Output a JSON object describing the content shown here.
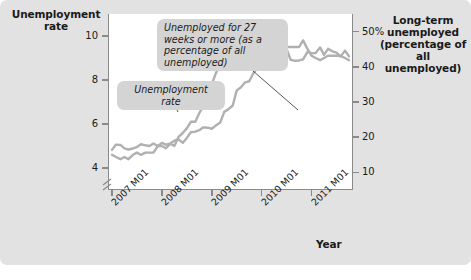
{
  "figure": {
    "background_color": "#e2e2e2",
    "plot_background": "#ffffff",
    "series_color": "#b0b0b0",
    "callout_bg": "#d4d4d4",
    "axis_color": "#8a8a8a"
  },
  "labels": {
    "left_axis_title": "Unemployment rate",
    "right_axis_title": "Long-term unemployed (percentage of all unemployed)",
    "x_axis_title": "Year",
    "callout_longterm": "Unemployed for 27 weeks or more (as a percentage of all unemployed)",
    "callout_urate": "Unemployment rate"
  },
  "chart_data": {
    "type": "line",
    "title": "",
    "xlabel": "Year",
    "ylabel": "Unemployment rate",
    "y2label": "Long-term unemployed (percentage of all unemployed)",
    "grid": false,
    "legend_position": "inline-callouts",
    "x_tick_labels": [
      "2007 M01",
      "2008 M01",
      "2009 M01",
      "2010 M01",
      "2011 M01"
    ],
    "x_tick_values": [
      2007.0,
      2008.0,
      2009.0,
      2010.0,
      2011.0
    ],
    "xlim": [
      2006.92,
      2011.83
    ],
    "y_left_ticks": [
      "4",
      "6",
      "8",
      "10"
    ],
    "y_left_tick_values": [
      4,
      6,
      8,
      10
    ],
    "ylim_left": [
      3.0,
      11.0
    ],
    "y_left_axis_break": true,
    "y_right_ticks": [
      "10",
      "20",
      "30",
      "40",
      "50%"
    ],
    "y_right_tick_values": [
      10,
      20,
      30,
      40,
      50
    ],
    "ylim_right": [
      5.0,
      55.0
    ],
    "x": [
      2007.0,
      2007.08,
      2007.17,
      2007.25,
      2007.33,
      2007.42,
      2007.5,
      2007.58,
      2007.67,
      2007.75,
      2007.83,
      2007.92,
      2008.0,
      2008.08,
      2008.17,
      2008.25,
      2008.33,
      2008.42,
      2008.5,
      2008.58,
      2008.67,
      2008.75,
      2008.83,
      2008.92,
      2009.0,
      2009.08,
      2009.17,
      2009.25,
      2009.33,
      2009.42,
      2009.5,
      2009.58,
      2009.67,
      2009.75,
      2009.83,
      2009.92,
      2010.0,
      2010.08,
      2010.17,
      2010.25,
      2010.33,
      2010.42,
      2010.5,
      2010.58,
      2010.67,
      2010.75,
      2010.83,
      2010.92,
      2011.0,
      2011.08,
      2011.17,
      2011.25,
      2011.33,
      2011.42,
      2011.5,
      2011.58,
      2011.67,
      2011.75
    ],
    "series": [
      {
        "name": "Unemployment rate",
        "axis": "left",
        "unit": "percent",
        "values": [
          4.6,
          4.5,
          4.4,
          4.5,
          4.4,
          4.6,
          4.7,
          4.6,
          4.7,
          4.7,
          4.7,
          5.0,
          5.0,
          4.9,
          5.1,
          5.0,
          5.4,
          5.6,
          5.8,
          6.1,
          6.1,
          6.5,
          6.8,
          7.3,
          7.8,
          8.3,
          8.7,
          9.0,
          9.4,
          9.5,
          9.5,
          9.6,
          9.8,
          10.0,
          9.9,
          9.9,
          9.8,
          9.8,
          9.9,
          9.9,
          9.6,
          9.4,
          9.5,
          9.5,
          9.5,
          9.5,
          9.8,
          9.4,
          9.1,
          9.0,
          8.9,
          9.0,
          9.1,
          9.1,
          9.1,
          9.1,
          9.0,
          8.9
        ]
      },
      {
        "name": "Unemployed for 27 weeks or more (as a percentage of all unemployed)",
        "axis": "right",
        "unit": "percent",
        "values": [
          16.4,
          17.9,
          17.8,
          16.8,
          16.5,
          16.8,
          17.2,
          18.0,
          17.7,
          17.5,
          18.2,
          17.5,
          18.4,
          17.9,
          18.2,
          19.0,
          19.4,
          18.4,
          19.8,
          21.4,
          21.6,
          22.0,
          22.8,
          22.7,
          22.4,
          23.3,
          24.2,
          27.2,
          27.9,
          29.0,
          33.3,
          34.1,
          35.6,
          35.9,
          38.1,
          39.8,
          41.2,
          41.1,
          44.3,
          45.9,
          46.0,
          45.5,
          45.0,
          42.0,
          41.7,
          41.8,
          42.1,
          44.3,
          43.8,
          43.9,
          45.5,
          43.4,
          45.1,
          44.4,
          44.0,
          42.9,
          44.6,
          43.0
        ]
      }
    ],
    "annotations": [
      {
        "text": "Unemployed for 27 weeks or more (as a percentage of all unemployed)",
        "points_to_series": "Unemployed for 27 weeks or more (as a percentage of all unemployed)"
      },
      {
        "text": "Unemployment rate",
        "points_to_series": "Unemployment rate"
      }
    ]
  }
}
